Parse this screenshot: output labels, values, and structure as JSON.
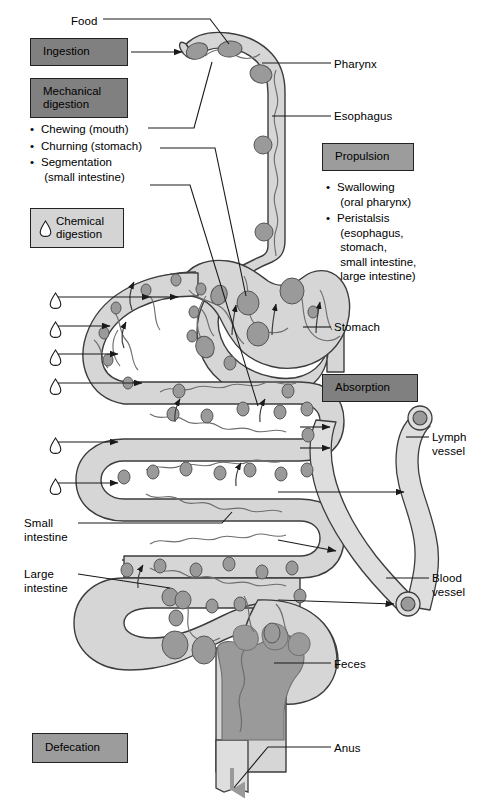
{
  "diagram": {
    "palette": {
      "dark_box": "#808080",
      "mid_box": "#9c9c9c",
      "light_box": "#d4d4d4",
      "tract_fill": "#d6d6d6",
      "tract_stroke": "#3c3c3c",
      "food_particle": "#9a9a9a",
      "feces_fill": "#9a9a9a",
      "vessel_fill": "#dcdcdc",
      "line": "#1a1a1a",
      "text": "#000000",
      "background": "#ffffff"
    }
  },
  "process_boxes": [
    {
      "id": "ingestion",
      "label": "Ingestion",
      "shade": "dark",
      "x": 30,
      "y": 38,
      "w": 98,
      "h": 28,
      "icon": ""
    },
    {
      "id": "mechanical",
      "label": "Mechanical\ndigestion",
      "shade": "dark",
      "x": 30,
      "y": 78,
      "w": 98,
      "h": 40,
      "icon": ""
    },
    {
      "id": "chemical",
      "label": "Chemical\ndigestion",
      "shade": "light",
      "x": 30,
      "y": 208,
      "w": 94,
      "h": 40,
      "icon": "droplet-icon"
    },
    {
      "id": "propulsion",
      "label": "Propulsion",
      "shade": "mid",
      "x": 322,
      "y": 143,
      "w": 92,
      "h": 28,
      "icon": ""
    },
    {
      "id": "absorption",
      "label": "Absorption",
      "shade": "dark",
      "x": 322,
      "y": 374,
      "w": 96,
      "h": 28,
      "icon": ""
    },
    {
      "id": "defecation",
      "label": "Defecation",
      "shade": "mid",
      "x": 32,
      "y": 733,
      "w": 96,
      "h": 30,
      "icon": ""
    }
  ],
  "bullet_groups": [
    {
      "id": "mechanical-bullets",
      "x": 30,
      "y": 122,
      "items": [
        "Chewing (mouth)",
        "Churning (stomach)",
        "Segmentation\n (small intestine)"
      ]
    },
    {
      "id": "propulsion-bullets",
      "x": 326,
      "y": 180,
      "items": [
        "Swallowing\n (oral pharynx)",
        "Peristalsis\n (esophagus,\n stomach,\n small intestine,\n large intestine)"
      ]
    }
  ],
  "anatomy_labels": [
    {
      "id": "food",
      "text": "Food",
      "x": 71,
      "y": 15,
      "align": "left"
    },
    {
      "id": "pharynx",
      "text": "Pharynx",
      "x": 334,
      "y": 58,
      "align": "left"
    },
    {
      "id": "esophagus",
      "text": "Esophagus",
      "x": 334,
      "y": 110,
      "align": "left"
    },
    {
      "id": "stomach",
      "text": "Stomach",
      "x": 334,
      "y": 321,
      "align": "left"
    },
    {
      "id": "lymph-vessel",
      "text": "Lymph\nvessel",
      "x": 432,
      "y": 431,
      "align": "left"
    },
    {
      "id": "blood-vessel",
      "text": "Blood\nvessel",
      "x": 432,
      "y": 572,
      "align": "left"
    },
    {
      "id": "small-intestine",
      "text": "Small\nintestine",
      "x": 24,
      "y": 517,
      "align": "left"
    },
    {
      "id": "large-intestine",
      "text": "Large\nintestine",
      "x": 24,
      "y": 568,
      "align": "left"
    },
    {
      "id": "feces",
      "text": "Feces",
      "x": 334,
      "y": 658,
      "align": "left"
    },
    {
      "id": "anus",
      "text": "Anus",
      "x": 334,
      "y": 742,
      "align": "left"
    }
  ],
  "chemical_droplets": [
    {
      "id": "droplet-1",
      "x": 41,
      "y": 292
    },
    {
      "id": "droplet-2",
      "x": 41,
      "y": 321
    },
    {
      "id": "droplet-3",
      "x": 41,
      "y": 349
    },
    {
      "id": "droplet-4",
      "x": 41,
      "y": 378
    },
    {
      "id": "droplet-5",
      "x": 41,
      "y": 437
    },
    {
      "id": "droplet-6",
      "x": 41,
      "y": 478
    }
  ],
  "structures": [
    {
      "id": "pharynx-mouth",
      "name": "Pharynx / mouth"
    },
    {
      "id": "esophagus-tube",
      "name": "Esophagus"
    },
    {
      "id": "stomach-organ",
      "name": "Stomach"
    },
    {
      "id": "small-intestine-coil",
      "name": "Small intestine"
    },
    {
      "id": "large-intestine-coil",
      "name": "Large intestine"
    },
    {
      "id": "rectum-anus",
      "name": "Rectum and anus"
    },
    {
      "id": "lymph-vessel-shape",
      "name": "Lymph vessel"
    },
    {
      "id": "blood-vessel-shape",
      "name": "Blood vessel"
    },
    {
      "id": "feces-mass",
      "name": "Feces"
    }
  ]
}
